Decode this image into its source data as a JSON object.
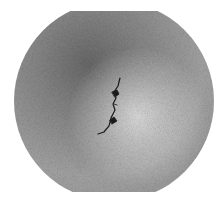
{
  "image": {
    "description": "Grayscale photograph of a circular disc specimen with a central crack",
    "background_color": "#ffffff",
    "disc": {
      "center_x": 114,
      "center_y": 101,
      "radius": 100,
      "clip_top": 11,
      "clip_bottom": 192,
      "dark_shade": "#6e6e6e",
      "mid_shade": "#9a9a9a",
      "light_shade": "#d4d4d4"
    },
    "crack": {
      "color": "#1a1a1a"
    }
  }
}
